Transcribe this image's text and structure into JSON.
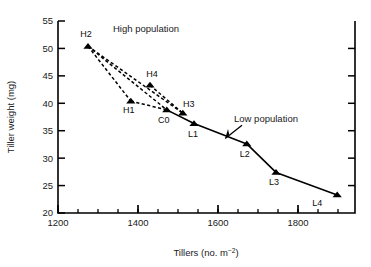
{
  "chart_data": {
    "type": "scatter",
    "title": "",
    "xlabel": "Tillers (no. m−2)",
    "ylabel": "Tiller weight (mg)",
    "xlim": [
      1200,
      1900
    ],
    "ylim": [
      20,
      55
    ],
    "xticks": [
      1200,
      1400,
      1600,
      1800
    ],
    "xtick_labels": [
      "1200",
      "1400",
      "1600",
      "1800"
    ],
    "xminor_step": 50,
    "yticks": [
      20,
      25,
      30,
      35,
      40,
      45,
      50,
      55
    ],
    "ytick_labels": [
      "20",
      "25",
      "30",
      "35",
      "40",
      "45",
      "50",
      "55"
    ],
    "grid": false,
    "legend": "none",
    "marker": "filled-triangle",
    "series": [
      {
        "name": "High population",
        "line_style": "dashed",
        "color": "#000000",
        "points": [
          {
            "label": "H2",
            "x": 1275,
            "y": 50.4,
            "label_dx": -2,
            "label_dy": -9
          },
          {
            "label": "H1",
            "x": 1382,
            "y": 40.4,
            "label_dx": -2,
            "label_dy": 12
          },
          {
            "label": "H4",
            "x": 1430,
            "y": 43.3,
            "label_dx": 2,
            "label_dy": -8
          },
          {
            "label": "C0",
            "x": 1472,
            "y": 38.8,
            "label_dx": -3,
            "label_dy": 13
          },
          {
            "label": "H3",
            "x": 1512,
            "y": 38.2,
            "label_dx": 6,
            "label_dy": -6
          }
        ],
        "segments": [
          [
            "H2",
            "H1"
          ],
          [
            "H2",
            "C0"
          ],
          [
            "H1",
            "C0"
          ],
          [
            "H4",
            "H3"
          ],
          [
            "H2",
            "H3"
          ]
        ]
      },
      {
        "name": "Low population",
        "line_style": "solid",
        "color": "#000000",
        "points": [
          {
            "label": "C0",
            "x": 1472,
            "y": 38.8,
            "label_dx": 0,
            "label_dy": 0,
            "hide_label": true
          },
          {
            "label": "L1",
            "x": 1540,
            "y": 36.3,
            "label_dx": -1,
            "label_dy": 13
          },
          {
            "label": "L2",
            "x": 1672,
            "y": 32.6,
            "label_dx": -2,
            "label_dy": 13
          },
          {
            "label": "L3",
            "x": 1745,
            "y": 27.4,
            "label_dx": -2,
            "label_dy": 13
          },
          {
            "label": "L4",
            "x": 1898,
            "y": 23.3,
            "label_dx": -20,
            "label_dy": 11
          }
        ]
      }
    ],
    "annotations": [
      {
        "name": "high-population-annotation",
        "text": "High population",
        "x": 1420,
        "y": 53.0
      },
      {
        "name": "low-population-annotation",
        "text": "Low population",
        "x": 1720,
        "y": 36.6
      }
    ]
  },
  "axis": {
    "x_label_main": "Tillers (no. m",
    "x_label_sup": "−2",
    "x_label_tail": ")",
    "y_label": "Tiller weight (mg)"
  }
}
